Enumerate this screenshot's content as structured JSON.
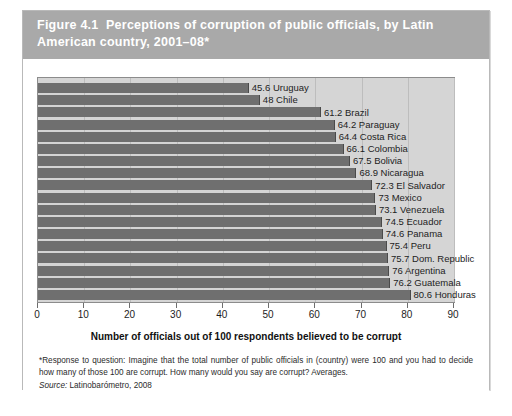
{
  "figure": {
    "number_label": "Figure 4.1",
    "title": "Perceptions of corruption of public officials, by Latin American country, 2001–08*",
    "header_full": "Figure 4.1  Perceptions of corruption of public officials, by Latin American country, 2001–08*"
  },
  "footnote": {
    "text": "*Response to question: Imagine that the total number of public officials in (country) were 100 and you had to decide how many of those 100 are corrupt. How many would you say are corrupt? Averages."
  },
  "source": {
    "label": "Source:",
    "text": " Latinobarómetro, 2008"
  },
  "colors": {
    "header_band": "#a9a9a9",
    "plot_background": "#d5d5d5",
    "bar_fill": "#6f6f6f",
    "gridline": "#bdbdbd",
    "panel_border": "#8c8c8c",
    "card_border": "#b9b9b9",
    "text": "#1d1d1d"
  },
  "chart_data": {
    "type": "bar",
    "orientation": "horizontal",
    "title": "Perceptions of corruption of public officials, by Latin American country, 2001–08*",
    "xlabel": "Number of officials out of 100 respondents believed to be corrupt",
    "ylabel": "",
    "xlim": [
      0,
      90
    ],
    "xticks": [
      0,
      10,
      20,
      30,
      40,
      50,
      60,
      70,
      80,
      90
    ],
    "xtick_labels": [
      "0",
      "10",
      "20",
      "30",
      "40",
      "50",
      "60",
      "70",
      "80",
      "90"
    ],
    "grid": "vertical",
    "legend": "none",
    "categories": [
      "Uruguay",
      "Chile",
      "Brazil",
      "Paraguay",
      "Costa Rica",
      "Colombia",
      "Bolivia",
      "Nicaragua",
      "El Salvador",
      "Mexico",
      "Venezuela",
      "Ecuador",
      "Panama",
      "Peru",
      "Dom. Republic",
      "Argentina",
      "Guatemala",
      "Honduras"
    ],
    "values": [
      45.6,
      48,
      61.2,
      64.2,
      64.4,
      66.1,
      67.5,
      68.9,
      72.3,
      73,
      73.1,
      74.5,
      74.6,
      75.4,
      75.7,
      76,
      76.2,
      80.6
    ],
    "data_labels": [
      "45.6 Uruguay",
      "48 Chile",
      "61.2 Brazil",
      "64.2 Paraguay",
      "64.4 Costa Rica",
      "66.1 Colombia",
      "67.5 Bolivia",
      "68.9 Nicaragua",
      "72.3 El Salvador",
      "73 Mexico",
      "73.1 Venezuela",
      "74.5 Ecuador",
      "74.6 Panama",
      "75.4 Peru",
      "75.7 Dom. Republic",
      "76 Argentina",
      "76.2 Guatemala",
      "80.6 Honduras"
    ]
  }
}
